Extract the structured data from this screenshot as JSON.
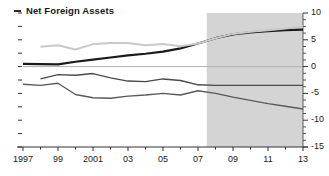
{
  "chart_data": {
    "type": "line",
    "title": "Net Foreign Assets",
    "xlabel": "",
    "ylabel": "",
    "legend_position": "top-left",
    "grid": false,
    "ylim": [
      -15,
      10
    ],
    "xlim": [
      1997,
      2013
    ],
    "yticks": [
      10,
      5,
      0,
      -5,
      -10,
      -15
    ],
    "ytick_labels": [
      "10",
      "5",
      "0",
      "-5",
      "-10",
      "-15"
    ],
    "y_axis_side": "right",
    "xticks": [
      1997,
      1998,
      1999,
      2000,
      2001,
      2002,
      2003,
      2004,
      2005,
      2006,
      2007,
      2008,
      2009,
      2010,
      2011,
      2012,
      2013
    ],
    "xtick_labels": [
      "1997",
      "",
      "99",
      "",
      "2001",
      "",
      "03",
      "",
      "05",
      "",
      "07",
      "",
      "09",
      "",
      "11",
      "",
      "13"
    ],
    "zero_line": 0,
    "shaded_region": {
      "label": "projection",
      "x_start": 2007.5,
      "x_end": 2013,
      "color": "#d4d4d4"
    },
    "x": [
      1997,
      1998,
      1999,
      2000,
      2001,
      2002,
      2003,
      2004,
      2005,
      2006,
      2007,
      2008,
      2009,
      2010,
      2011,
      2012,
      2013
    ],
    "series": [
      {
        "name": "series-dark-upper",
        "color": "#1a1a1a",
        "width": 2.2,
        "values": [
          0.5,
          0.45,
          0.4,
          0.9,
          1.3,
          1.7,
          2.1,
          2.4,
          2.8,
          3.4,
          4.3,
          5.3,
          6.0,
          6.4,
          6.6,
          6.8,
          6.9
        ]
      },
      {
        "name": "series-light-upper",
        "color": "#c9c9c9",
        "width": 2.0,
        "values": [
          null,
          3.7,
          4.0,
          3.2,
          4.2,
          4.4,
          4.4,
          4.0,
          4.2,
          3.8,
          4.3,
          5.3,
          6.1,
          6.5,
          6.8,
          7.1,
          7.5
        ]
      },
      {
        "name": "series-mid-lower",
        "color": "#4a4a4a",
        "width": 1.4,
        "values": [
          null,
          -2.3,
          -1.5,
          -1.6,
          -1.3,
          -2.1,
          -2.7,
          -2.8,
          -2.3,
          -2.6,
          -3.4,
          -3.5,
          -3.5,
          -3.5,
          -3.5,
          -3.5,
          -3.5
        ]
      },
      {
        "name": "series-low-lower",
        "color": "#5a5a5a",
        "width": 1.4,
        "values": [
          -3.3,
          -3.5,
          -3.1,
          -5.2,
          -5.8,
          -5.9,
          -5.5,
          -5.3,
          -5.0,
          -5.3,
          -4.5,
          -5.0,
          -5.7,
          -6.3,
          -6.9,
          -7.4,
          -7.9
        ]
      }
    ]
  },
  "legend": {
    "marker_name": "line-dash-marker",
    "label": "Net Foreign Assets"
  }
}
